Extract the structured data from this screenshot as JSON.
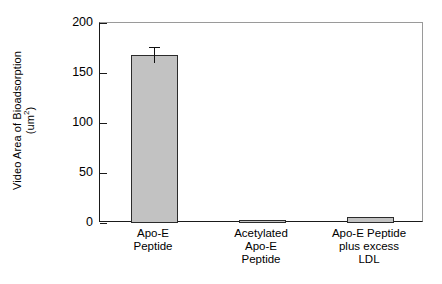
{
  "chart_data": {
    "type": "bar",
    "title": "",
    "subtitle": "",
    "xlabel": "",
    "ylabel": "Video Area of Bioadsorption (um²)",
    "ylabel_line1": "Video Area of Bioadsorption",
    "ylabel_line2_prefix": "(um",
    "ylabel_line2_sup": "2",
    "ylabel_line2_suffix": ")",
    "categories": [
      "Apo-E\nPeptide",
      "Acetylated\nApo-E\nPeptide",
      "Apo-E Peptide\nplus excess\nLDL"
    ],
    "values": [
      168,
      3,
      6
    ],
    "errors": [
      8,
      0,
      0
    ],
    "ylim": [
      0,
      200
    ],
    "yticks": [
      0,
      50,
      100,
      150,
      200
    ],
    "ytick_labels": [
      "0",
      "50",
      "100",
      "150",
      "200"
    ],
    "grid": false,
    "legend": false,
    "legend_position": "none",
    "bar_fill_color": "#c2c2c2",
    "bar_edge_color": "#2b2b2b",
    "axis_color": "#1a1a1a",
    "error_bar_color": "#111111",
    "background_color": "#ffffff"
  }
}
